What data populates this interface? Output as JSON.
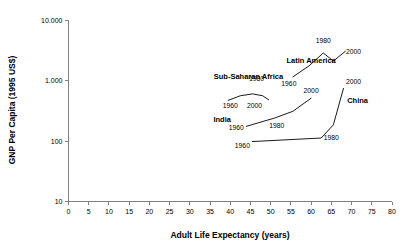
{
  "chart_data": {
    "type": "line",
    "title": "",
    "xlabel": "Adult Life Expectancy (years)",
    "ylabel": "GNP Per Capita (1995 US$)",
    "xlim": [
      0,
      80
    ],
    "ylim": [
      10,
      10000
    ],
    "yscale": "log",
    "grid": false,
    "legend": "inline-labels",
    "xticks": [
      "0",
      "5",
      "10",
      "15",
      "20",
      "25",
      "30",
      "35",
      "40",
      "45",
      "50",
      "55",
      "60",
      "65",
      "70",
      "75",
      "80"
    ],
    "yticks": [
      "10",
      "100",
      "1.000",
      "10.000"
    ],
    "series": [
      {
        "name": "Latin America",
        "label_x": 60,
        "label_y": 1950,
        "points": [
          {
            "year": "1960",
            "x": 55.5,
            "y": 1150
          },
          {
            "year": "1970",
            "x": 59.5,
            "y": 1750
          },
          {
            "year": "1980",
            "x": 63.0,
            "y": 2850
          },
          {
            "year": "1990",
            "x": 65.5,
            "y": 2100
          },
          {
            "year": "2000",
            "x": 68.5,
            "y": 3050
          }
        ],
        "year_labels": [
          {
            "text": "1960",
            "x": 54.5,
            "y": 820
          },
          {
            "text": "1980",
            "x": 63.0,
            "y": 4100
          },
          {
            "text": "2000",
            "x": 70.5,
            "y": 2700
          }
        ]
      },
      {
        "name": "Sub-Saharan Africa",
        "label_x": 44.5,
        "label_y": 1060,
        "points": [
          {
            "year": "1960",
            "x": 39.5,
            "y": 470
          },
          {
            "year": "1970",
            "x": 42.5,
            "y": 560
          },
          {
            "year": "1980",
            "x": 45.5,
            "y": 600
          },
          {
            "year": "1990",
            "x": 48.0,
            "y": 560
          },
          {
            "year": "2000",
            "x": 49.5,
            "y": 480
          }
        ],
        "year_labels": [
          {
            "text": "1960",
            "x": 40.0,
            "y": 355
          },
          {
            "text": "1980",
            "x": 46.5,
            "y": 980
          },
          {
            "text": "2000",
            "x": 46.0,
            "y": 355
          }
        ]
      },
      {
        "name": "India",
        "label_x": 38.0,
        "label_y": 205,
        "points": [
          {
            "year": "1960",
            "x": 44.0,
            "y": 175
          },
          {
            "year": "1980",
            "x": 51.0,
            "y": 240
          },
          {
            "year": "1990",
            "x": 55.5,
            "y": 310
          },
          {
            "year": "2000",
            "x": 60.0,
            "y": 510
          }
        ],
        "year_labels": [
          {
            "text": "1960",
            "x": 41.5,
            "y": 150
          },
          {
            "text": "1980",
            "x": 51.5,
            "y": 162
          },
          {
            "text": "2000",
            "x": 60.0,
            "y": 620
          }
        ]
      },
      {
        "name": "China",
        "label_x": 71.5,
        "label_y": 420,
        "points": [
          {
            "year": "1960",
            "x": 45.5,
            "y": 98
          },
          {
            "year": "1980",
            "x": 62.5,
            "y": 112
          },
          {
            "year": "1990",
            "x": 65.5,
            "y": 185
          },
          {
            "year": "2000",
            "x": 68.0,
            "y": 740
          }
        ],
        "year_labels": [
          {
            "text": "1960",
            "x": 43.0,
            "y": 77
          },
          {
            "text": "1980",
            "x": 65.0,
            "y": 105
          },
          {
            "text": "2000",
            "x": 70.5,
            "y": 870
          }
        ]
      }
    ]
  }
}
